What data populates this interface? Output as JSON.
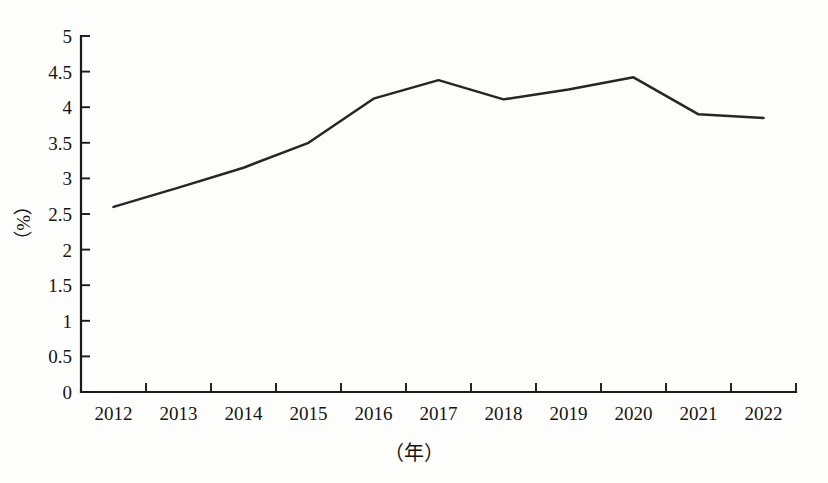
{
  "chart_data": {
    "type": "line",
    "title": "",
    "subtitle": "",
    "xlabel": "（年）",
    "ylabel": "（%）",
    "categories": [
      "2012",
      "2013",
      "2014",
      "2015",
      "2016",
      "2017",
      "2018",
      "2019",
      "2020",
      "2021",
      "2022"
    ],
    "values": [
      2.6,
      2.87,
      3.15,
      3.5,
      4.12,
      4.38,
      4.11,
      4.25,
      4.42,
      3.9,
      3.85
    ],
    "series": [
      {
        "name": "",
        "values": [
          2.6,
          2.87,
          3.15,
          3.5,
          4.12,
          4.38,
          4.11,
          4.25,
          4.42,
          3.9,
          3.85
        ]
      }
    ],
    "ylim": [
      0,
      5
    ],
    "ytick_labels": [
      "0",
      "0.5",
      "1",
      "1.5",
      "2",
      "2.5",
      "3",
      "3.5",
      "4",
      "4.5",
      "5"
    ],
    "ytick_values": [
      0,
      0.5,
      1,
      1.5,
      2,
      2.5,
      3,
      3.5,
      4,
      4.5,
      5
    ],
    "xtick_labels": [
      "2012",
      "2013",
      "2014",
      "2015",
      "2016",
      "2017",
      "2018",
      "2019",
      "2020",
      "2021",
      "2022"
    ],
    "grid": false,
    "legend": false,
    "legend_position": "none",
    "line_color": "#262626",
    "axis_color": "#1a1a1a",
    "background_color": "#fdfdfb"
  },
  "axes": {
    "y_title": "（%）",
    "x_title": "（年）"
  }
}
